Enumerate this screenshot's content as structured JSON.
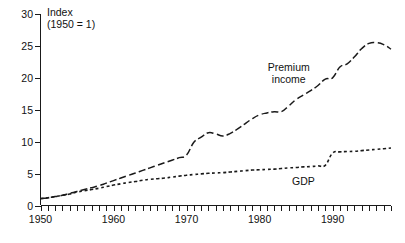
{
  "chart_data": {
    "type": "line",
    "title": "",
    "subtitle": "",
    "xlabel": "",
    "ylabel": "Index",
    "ylabel_line1": "Index",
    "ylabel_line2": "(1950 = 1)",
    "xlim": [
      1950,
      1998
    ],
    "ylim": [
      0,
      30
    ],
    "yticks": [
      0,
      5,
      10,
      15,
      20,
      25,
      30
    ],
    "ytick_labels": [
      "0",
      "5",
      "10",
      "15",
      "20",
      "25",
      "30"
    ],
    "xticks": [
      1950,
      1960,
      1970,
      1980,
      1990
    ],
    "xtick_labels": [
      "1950",
      "1960",
      "1970",
      "1980",
      "1990"
    ],
    "x_minor_tick_interval": 1,
    "grid": false,
    "legend": "inline-annotations",
    "annotations": [
      {
        "name": "premium-income-label",
        "text_line1": "Premium",
        "text_line2": "income",
        "x": 1984.0,
        "y": 21.0
      },
      {
        "name": "gdp-label",
        "text": "GDP",
        "x": 1986.0,
        "y": 3.2
      }
    ],
    "series": [
      {
        "name": "Premium income",
        "label": "Premium income",
        "style": "long-dashed",
        "color": "#1a1a1a",
        "x": [
          1950,
          1951,
          1952,
          1953,
          1954,
          1955,
          1956,
          1957,
          1958,
          1959,
          1960,
          1961,
          1962,
          1963,
          1964,
          1965,
          1966,
          1967,
          1968,
          1969,
          1970,
          1971,
          1972,
          1973,
          1974,
          1975,
          1976,
          1977,
          1978,
          1979,
          1980,
          1981,
          1982,
          1983,
          1984,
          1985,
          1986,
          1987,
          1988,
          1989,
          1990,
          1991,
          1992,
          1993,
          1994,
          1995,
          1996,
          1997,
          1998
        ],
        "values": [
          1.1,
          1.2,
          1.4,
          1.6,
          1.9,
          2.2,
          2.5,
          2.8,
          3.1,
          3.5,
          3.9,
          4.3,
          4.7,
          5.1,
          5.5,
          5.9,
          6.3,
          6.7,
          7.1,
          7.5,
          7.9,
          9.9,
          10.7,
          11.4,
          11.2,
          10.9,
          11.3,
          12.0,
          12.8,
          13.6,
          14.2,
          14.5,
          14.7,
          14.7,
          15.6,
          16.6,
          17.3,
          18.0,
          18.8,
          19.8,
          20.0,
          21.7,
          22.2,
          23.3,
          24.6,
          25.4,
          25.5,
          25.2,
          24.5
        ]
      },
      {
        "name": "GDP",
        "label": "GDP",
        "style": "short-dashed",
        "color": "#1a1a1a",
        "x": [
          1950,
          1951,
          1952,
          1953,
          1954,
          1955,
          1956,
          1957,
          1958,
          1959,
          1960,
          1961,
          1962,
          1963,
          1964,
          1965,
          1966,
          1967,
          1968,
          1969,
          1970,
          1971,
          1972,
          1973,
          1974,
          1975,
          1976,
          1977,
          1978,
          1979,
          1980,
          1981,
          1982,
          1983,
          1984,
          1985,
          1986,
          1987,
          1988,
          1989,
          1990,
          1991,
          1992,
          1993,
          1994,
          1995,
          1996,
          1997,
          1998
        ],
        "values": [
          1.05,
          1.2,
          1.4,
          1.6,
          1.8,
          2.1,
          2.3,
          2.5,
          2.7,
          2.95,
          3.2,
          3.4,
          3.6,
          3.75,
          3.95,
          4.1,
          4.2,
          4.3,
          4.45,
          4.6,
          4.75,
          4.85,
          4.95,
          5.05,
          5.1,
          5.15,
          5.25,
          5.35,
          5.45,
          5.55,
          5.6,
          5.65,
          5.7,
          5.8,
          5.9,
          5.95,
          6.05,
          6.1,
          6.2,
          6.3,
          8.2,
          8.4,
          8.45,
          8.5,
          8.6,
          8.7,
          8.8,
          8.9,
          9.0
        ]
      }
    ]
  }
}
